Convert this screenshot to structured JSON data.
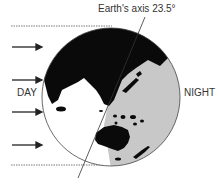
{
  "diagram": {
    "labels": {
      "axis": "Earth's axis 23.5°",
      "day": "DAY",
      "night": "NIGHT"
    },
    "axis_tilt_degrees": 23.5,
    "sunlight_arrows": 4,
    "colors": {
      "land": "#0a0a0a",
      "night_ocean": "#c8c8c8",
      "day_ocean": "#ffffff",
      "outline": "#444444",
      "label_text": "#333333"
    },
    "icons": {
      "sun_ray": "arrow-right-icon"
    }
  }
}
